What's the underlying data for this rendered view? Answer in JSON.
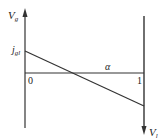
{
  "diagram": {
    "left_axis_label": "V",
    "left_axis_subscript": "g",
    "right_axis_label": "V",
    "right_axis_subscript": "l",
    "intercept_label": "j",
    "intercept_subscript": "gl",
    "origin_label": "0",
    "x_axis_label": "α",
    "x_end_label": "1",
    "colors": {
      "line": "#333333",
      "text": "#222222"
    }
  }
}
